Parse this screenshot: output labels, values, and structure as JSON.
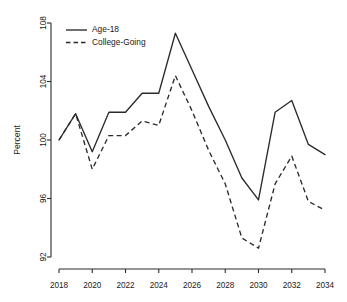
{
  "chart_data": {
    "type": "line",
    "title": "",
    "xlabel": "",
    "ylabel": "Percent",
    "x": [
      2018,
      2019,
      2020,
      2021,
      2022,
      2023,
      2024,
      2025,
      2026,
      2027,
      2028,
      2029,
      2030,
      2031,
      2032,
      2033,
      2034
    ],
    "xlim": [
      2018,
      2034
    ],
    "ylim": [
      92,
      108
    ],
    "xticks": [
      2018,
      2020,
      2022,
      2024,
      2026,
      2028,
      2030,
      2032,
      2034
    ],
    "xtick_labels": [
      "2018",
      "2020",
      "2022",
      "2024",
      "2026",
      "2028",
      "2030",
      "2032",
      "2034"
    ],
    "yticks": [
      92,
      96,
      100,
      104,
      108
    ],
    "ytick_labels": [
      "92",
      "96",
      "100",
      "104",
      "108"
    ],
    "grid": false,
    "legend_position": "top-left",
    "series": [
      {
        "name": "Age-18",
        "style": "solid",
        "color": "#2b2b2b",
        "values": [
          100.0,
          101.8,
          99.2,
          101.9,
          101.9,
          103.2,
          103.2,
          107.3,
          104.8,
          102.3,
          100.0,
          97.4,
          95.9,
          101.9,
          102.7,
          99.7,
          99.0
        ]
      },
      {
        "name": "College-Going",
        "style": "dashed",
        "color": "#2b2b2b",
        "values": [
          100.0,
          101.8,
          98.0,
          100.3,
          100.3,
          101.3,
          101.0,
          104.4,
          102.0,
          99.3,
          97.0,
          93.3,
          92.6,
          97.0,
          98.9,
          95.8,
          95.2
        ]
      }
    ]
  }
}
